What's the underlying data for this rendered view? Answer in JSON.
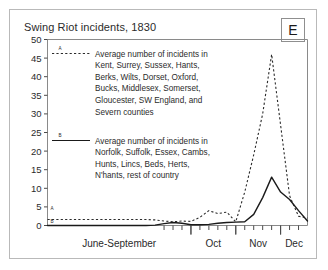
{
  "card": {
    "title": "Swing Riot incidents, 1830",
    "badge_label": "E"
  },
  "chart_data": {
    "type": "line",
    "title": "Swing Riot incidents, 1830",
    "xlabel": "",
    "ylabel": "",
    "ylim": [
      0,
      50
    ],
    "yticks": [
      0,
      5,
      10,
      15,
      20,
      25,
      30,
      35,
      40,
      45,
      50
    ],
    "grid": false,
    "legend_position": "inside-upper-left",
    "xtick_labels": [
      "June-September",
      "Oct",
      "Nov",
      "Dec"
    ],
    "x_axis_note": "Weekly intervals; month group boundaries marked by longer ticks",
    "x": [
      0,
      1,
      2,
      3,
      4,
      5,
      6,
      7,
      8,
      9,
      10,
      11,
      12,
      13,
      14,
      15,
      16,
      17,
      18,
      19,
      20,
      21,
      22,
      23,
      24,
      25,
      26,
      27,
      28,
      29
    ],
    "series": [
      {
        "name": "A",
        "style": "dashed",
        "color": "#2b2b2b",
        "label": "Average number of incidents in Kent, Surrey, Sussex, Hants, Berks, Wilts, Dorset, Oxford, Bucks, Middlesex, Somerset, Gloucester, SW England, and Severn counties",
        "label_lines": [
          "Average number of incidents in",
          "Kent, Surrey, Sussex, Hants,",
          "Berks, Wilts, Dorset, Oxford,",
          "Bucks, Middlesex, Somerset,",
          "Gloucester, SW England, and",
          "Severn counties"
        ],
        "values": [
          1.6,
          1.6,
          1.6,
          1.6,
          1.6,
          1.6,
          1.6,
          1.6,
          1.6,
          1.6,
          1.6,
          1.6,
          1.5,
          1.2,
          1.0,
          1.2,
          1.1,
          2.2,
          4.0,
          3.2,
          3.6,
          1.0,
          9.0,
          19.0,
          30.0,
          46.0,
          27.0,
          8.0,
          2.5,
          2.0
        ],
        "peak_value": 46,
        "peak_label": "mid-November"
      },
      {
        "name": "B",
        "style": "solid",
        "color": "#1a1a1a",
        "label": "Average number of incidents in Norfolk, Suffolk, Essex, Cambs, Hunts, Lincs, Beds, Herts, N'hants, rest of country",
        "label_lines": [
          "Average number of incidents in",
          "Norfolk, Suffolk, Essex, Cambs,",
          "Hunts, Lincs, Beds, Herts,",
          "N'hants, rest of country"
        ],
        "values": [
          0,
          0,
          0,
          0,
          0,
          0,
          0,
          0,
          0,
          0,
          0,
          0,
          0.1,
          0.5,
          0.8,
          0.6,
          0.2,
          0.2,
          0.3,
          0.6,
          0.8,
          0.9,
          1.0,
          3.0,
          7.5,
          13.0,
          9.0,
          7.0,
          4.0,
          1.2
        ],
        "peak_value": 13,
        "peak_label": "early December"
      }
    ]
  }
}
